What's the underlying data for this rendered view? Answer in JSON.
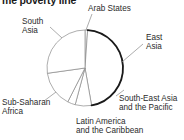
{
  "chart_data": {
    "type": "pie",
    "title": "me poverty line",
    "title_note": "title is clipped at the top edge of the screenshot",
    "categories": [
      "Arab States",
      "East Asia",
      "South-East Asia and the Pacific",
      "Latin America and the Caribbean",
      "Sub-Saharan Africa",
      "South Asia"
    ],
    "values": [
      1,
      46,
      7,
      3,
      15,
      28
    ],
    "unit": "percent",
    "legend": "none",
    "grid": false,
    "xlabel": "",
    "ylabel": "",
    "slices": [
      {
        "label": "Arab States",
        "label_lines": [
          "Arab States"
        ],
        "value": 1,
        "start_angle": 0,
        "end_angle": 4,
        "emphasis": false
      },
      {
        "label": "East Asia",
        "label_lines": [
          "East",
          "Asia"
        ],
        "value": 46,
        "start_angle": 4,
        "end_angle": 170,
        "emphasis": true
      },
      {
        "label": "South-East Asia and the Pacific",
        "label_lines": [
          "South-East Asia",
          "and the Pacific"
        ],
        "value": 7,
        "start_angle": 170,
        "end_angle": 195,
        "emphasis": false
      },
      {
        "label": "Latin America and the Caribbean",
        "label_lines": [
          "Latin America",
          "and the Caribbean"
        ],
        "value": 3,
        "start_angle": 195,
        "end_angle": 207,
        "emphasis": false
      },
      {
        "label": "Sub-Saharan Africa",
        "label_lines": [
          "Sub-Saharan",
          "Africa"
        ],
        "value": 15,
        "start_angle": 207,
        "end_angle": 262,
        "emphasis": false
      },
      {
        "label": "South Asia",
        "label_lines": [
          "South",
          "Asia"
        ],
        "value": 28,
        "start_angle": 262,
        "end_angle": 360,
        "emphasis": false
      }
    ],
    "geometry": {
      "center_x": 85,
      "center_y": 68,
      "radius": 38
    },
    "colors": {
      "slice_fill": "#ffffff",
      "slice_stroke": "#8a8a8a",
      "emphasis_stroke": "#1a1a1a",
      "label_text": "#2b2b2b",
      "title_text": "#1a1a1a",
      "background": "#ffffff"
    }
  },
  "labels": {
    "arab_states": {
      "l1": "Arab States"
    },
    "east_asia": {
      "l1": "East",
      "l2": "Asia"
    },
    "south_asia": {
      "l1": "South",
      "l2": "Asia"
    },
    "sub_saharan": {
      "l1": "Sub-Saharan",
      "l2": "Africa"
    },
    "latin_america": {
      "l1": "Latin America",
      "l2": "and the Caribbean"
    },
    "south_east_asia": {
      "l1": "South-East Asia",
      "l2": "and the Pacific"
    }
  }
}
